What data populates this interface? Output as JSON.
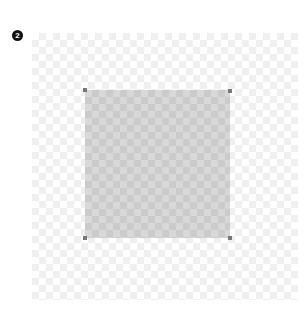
{
  "step_badge": {
    "label": "2"
  },
  "canvas": {
    "background": "transparent-checkerboard",
    "selection": {
      "fill": "semi-transparent-gray",
      "handles": [
        "top-left",
        "top-right",
        "bottom-left",
        "bottom-right"
      ]
    }
  },
  "colors": {
    "badge": "#111111",
    "checker_light": "#efefef",
    "selection_fill": "#d8d8d8",
    "handle": "#777777"
  }
}
